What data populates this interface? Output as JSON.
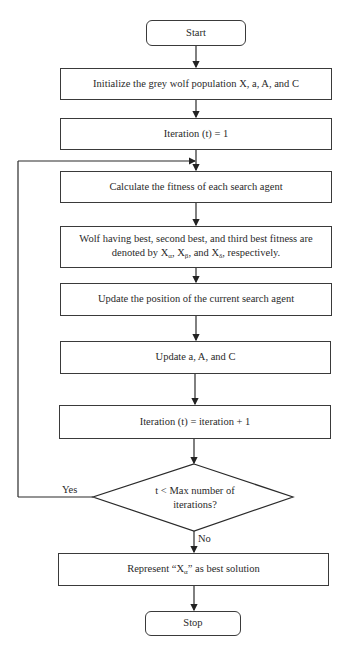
{
  "diagram": {
    "type": "flowchart",
    "nodes": {
      "start": "Start",
      "init": "Initialize the grey wolf population X, a, A, and C",
      "iter_init": "Iteration (t) = 1",
      "fitness": "Calculate the fitness of each search agent",
      "rank_line1": "Wolf having best, second best, and third best fitness are",
      "rank_line2_prefix": "denoted by X",
      "rank_sub_alpha": "α",
      "rank_sep1": ", X",
      "rank_sub_beta": "β",
      "rank_sep2": ", and X",
      "rank_sub_delta": "δ",
      "rank_suffix": ", respectively.",
      "update_pos": "Update the position of the current search agent",
      "update_params": "Update a, A, and C",
      "iter_inc": "Iteration (t) = iteration + 1",
      "decision_line1": "t < Max number of",
      "decision_line2": "iterations?",
      "result_prefix": "Represent “X",
      "result_sub": "α",
      "result_suffix": "” as best solution",
      "stop": "Stop"
    },
    "edges": {
      "yes_label": "Yes",
      "no_label": "No"
    }
  }
}
